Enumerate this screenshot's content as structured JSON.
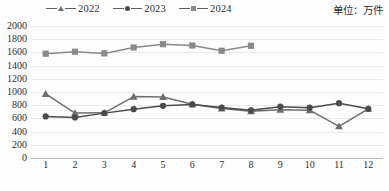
{
  "unit_label": "单位：万件",
  "legend": {
    "items": [
      {
        "label": "2022",
        "marker": "triangle-marker",
        "color": "#6e6e6e"
      },
      {
        "label": "2023",
        "marker": "circle-marker",
        "color": "#4b4b4b"
      },
      {
        "label": "2024",
        "marker": "square-marker",
        "color": "#8a8a8a"
      }
    ]
  },
  "caption": "",
  "chart_data": {
    "type": "line",
    "title": "",
    "subtitle": "",
    "xlabel": "",
    "ylabel": "",
    "unit": "万件",
    "grid": true,
    "legend_position": "top-left",
    "ylim": [
      0,
      2000
    ],
    "yticks": [
      0,
      200,
      400,
      600,
      800,
      1000,
      1200,
      1400,
      1600,
      1800,
      2000
    ],
    "ytick_labels": [
      "0",
      "200",
      "400",
      "600",
      "800",
      "1000",
      "1200",
      "1400",
      "1600",
      "1800",
      "2000"
    ],
    "categories": [
      "1",
      "2",
      "3",
      "4",
      "5",
      "6",
      "7",
      "8",
      "9",
      "10",
      "11",
      "12"
    ],
    "x": [
      1,
      2,
      3,
      4,
      5,
      6,
      7,
      8,
      9,
      10,
      11,
      12
    ],
    "series": [
      {
        "name": "2022",
        "marker": "triangle",
        "color": "#6e6e6e",
        "values": [
          970,
          680,
          685,
          930,
          925,
          815,
          750,
          710,
          730,
          725,
          480,
          745
        ]
      },
      {
        "name": "2023",
        "marker": "circle",
        "color": "#4b4b4b",
        "values": [
          630,
          615,
          680,
          740,
          790,
          812,
          765,
          722,
          778,
          762,
          830,
          745
        ]
      },
      {
        "name": "2024",
        "marker": "square",
        "color": "#8a8a8a",
        "values": [
          1580,
          1610,
          1585,
          1675,
          1725,
          1705,
          1625,
          1700,
          null,
          null,
          null,
          null
        ]
      }
    ]
  }
}
